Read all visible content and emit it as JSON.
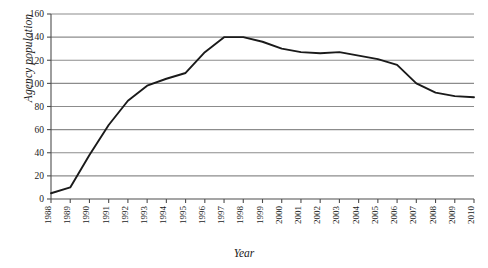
{
  "chart_data": {
    "type": "line",
    "title": "",
    "xlabel": "Year",
    "ylabel": "Agency population",
    "grid": true,
    "legend": "none",
    "xlim": [
      1988,
      2010
    ],
    "ylim": [
      0,
      160
    ],
    "y_ticks": [
      0,
      20,
      40,
      60,
      80,
      100,
      120,
      140,
      160
    ],
    "categories": [
      "1988",
      "1989",
      "1990",
      "1991",
      "1992",
      "1993",
      "1994",
      "1995",
      "1996",
      "1997",
      "1998",
      "1999",
      "2000",
      "2001",
      "2002",
      "2003",
      "2004",
      "2005",
      "2006",
      "2007",
      "2008",
      "2009",
      "2010"
    ],
    "x": [
      1988,
      1989,
      1990,
      1991,
      1992,
      1993,
      1994,
      1995,
      1996,
      1997,
      1998,
      1999,
      2000,
      2001,
      2002,
      2003,
      2004,
      2005,
      2006,
      2007,
      2008,
      2009,
      2010
    ],
    "values": [
      5,
      10,
      38,
      64,
      85,
      98,
      104,
      109,
      127,
      140,
      140,
      136,
      130,
      127,
      126,
      127,
      124,
      121,
      116,
      100,
      92,
      89,
      88
    ],
    "series": [
      {
        "name": "Agency population",
        "color": "#1a1a1a",
        "values": [
          5,
          10,
          38,
          64,
          85,
          98,
          104,
          109,
          127,
          140,
          140,
          136,
          130,
          127,
          126,
          127,
          124,
          121,
          116,
          100,
          92,
          89,
          88
        ]
      }
    ],
    "colors": {
      "line": "#1a1a1a",
      "grid": "#8c8c8c",
      "axis": "#4d4d4d",
      "background": "#ffffff"
    }
  }
}
